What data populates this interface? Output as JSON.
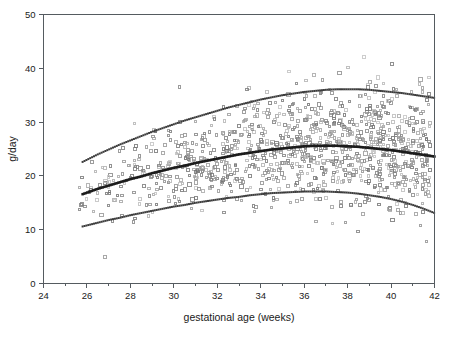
{
  "chart_data": {
    "type": "scatter",
    "title": "",
    "xlabel": "gestational age (weeks)",
    "ylabel": "g/day",
    "xlim": [
      24,
      42
    ],
    "ylim": [
      0,
      50
    ],
    "xticks": [
      24,
      26,
      28,
      30,
      32,
      34,
      36,
      38,
      40,
      42
    ],
    "xtick_labels": [
      "24",
      "26",
      "28",
      "30",
      "32",
      "34",
      "36",
      "38",
      "40",
      "42"
    ],
    "xminor_ticks": [
      25,
      27,
      29,
      31,
      33,
      35,
      37,
      39,
      41
    ],
    "yticks": [
      0,
      10,
      20,
      30,
      40,
      50
    ],
    "ytick_labels": [
      "0",
      "10",
      "20",
      "30",
      "40",
      "50"
    ],
    "grid": false,
    "legend": false,
    "point_marker": "open-square",
    "point_color": "#8c8c8c",
    "curve_color": "#2a2a2a",
    "series": [
      {
        "name": "upper percentile curve",
        "style": "dotted",
        "x": [
          25.8,
          26.5,
          27.0,
          27.5,
          28.0,
          28.5,
          29.0,
          29.5,
          30.0,
          30.5,
          31.0,
          31.5,
          32.0,
          32.5,
          33.0,
          33.5,
          34.0,
          34.5,
          35.0,
          35.5,
          36.0,
          36.5,
          37.0,
          37.5,
          38.0,
          38.5,
          39.0,
          39.5,
          40.0,
          40.5,
          41.0,
          41.5,
          42.0
        ],
        "values": [
          22.6,
          24.0,
          24.9,
          25.8,
          26.6,
          27.4,
          28.2,
          28.9,
          29.6,
          30.3,
          30.9,
          31.5,
          32.1,
          32.7,
          33.2,
          33.7,
          34.2,
          34.6,
          35.0,
          35.3,
          35.6,
          35.8,
          36.0,
          36.1,
          36.1,
          36.1,
          36.0,
          35.8,
          35.6,
          35.4,
          35.1,
          34.8,
          34.5
        ]
      },
      {
        "name": "median curve",
        "style": "dotted-bold",
        "x": [
          25.8,
          26.5,
          27.0,
          27.5,
          28.0,
          28.5,
          29.0,
          29.5,
          30.0,
          30.5,
          31.0,
          31.5,
          32.0,
          32.5,
          33.0,
          33.5,
          34.0,
          34.5,
          35.0,
          35.5,
          36.0,
          36.5,
          37.0,
          37.5,
          38.0,
          38.5,
          39.0,
          39.5,
          40.0,
          40.5,
          41.0,
          41.5,
          42.0
        ],
        "values": [
          16.6,
          17.6,
          18.2,
          18.8,
          19.4,
          19.9,
          20.5,
          21.0,
          21.5,
          21.9,
          22.4,
          22.8,
          23.2,
          23.6,
          24.0,
          24.3,
          24.6,
          24.9,
          25.1,
          25.3,
          25.5,
          25.6,
          25.6,
          25.6,
          25.5,
          25.4,
          25.2,
          25.0,
          24.8,
          24.5,
          24.2,
          23.9,
          23.6
        ]
      },
      {
        "name": "lower percentile curve",
        "style": "dotted",
        "x": [
          25.8,
          26.5,
          27.0,
          27.5,
          28.0,
          28.5,
          29.0,
          29.5,
          30.0,
          30.5,
          31.0,
          31.5,
          32.0,
          32.5,
          33.0,
          33.5,
          34.0,
          34.5,
          35.0,
          35.5,
          36.0,
          36.5,
          37.0,
          37.5,
          38.0,
          38.5,
          39.0,
          39.5,
          40.0,
          40.5,
          41.0,
          41.5,
          42.0
        ],
        "values": [
          10.6,
          11.3,
          11.8,
          12.2,
          12.7,
          13.1,
          13.5,
          13.9,
          14.3,
          14.6,
          15.0,
          15.3,
          15.6,
          15.9,
          16.1,
          16.4,
          16.6,
          16.8,
          16.9,
          17.0,
          17.1,
          17.1,
          17.1,
          17.0,
          16.9,
          16.7,
          16.4,
          16.1,
          15.7,
          15.2,
          14.6,
          13.9,
          13.1
        ]
      }
    ]
  }
}
